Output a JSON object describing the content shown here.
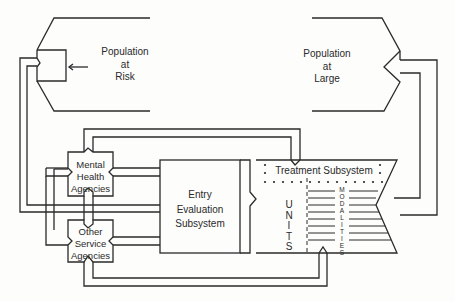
{
  "diagram": {
    "nodes": {
      "population_at_risk": {
        "lines": [
          "Population",
          "at",
          "Risk"
        ]
      },
      "population_at_large": {
        "lines": [
          "Population",
          "at",
          "Large"
        ]
      },
      "mental_health_agencies": {
        "lines": [
          "Mental",
          "Health",
          "Agencies"
        ]
      },
      "other_service_agencies": {
        "lines": [
          "Other",
          "Service",
          "Agencies"
        ]
      },
      "entry_evaluation_subsystem": {
        "lines": [
          "Entry",
          "Evaluation",
          "Subsystem"
        ]
      },
      "treatment_subsystem": {
        "label": "Treatment Subsystem"
      },
      "units": {
        "letters": [
          "U",
          "N",
          "I",
          "T",
          "S"
        ]
      },
      "modalities": {
        "letters": [
          "M",
          "O",
          "D",
          "A",
          "L",
          "I",
          "T",
          "I",
          "E",
          "S"
        ]
      }
    },
    "colors": {
      "ink": "#2a2a2a",
      "paper": "#fdfdfb"
    }
  }
}
